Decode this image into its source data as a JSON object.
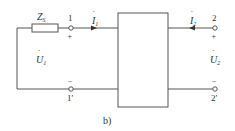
{
  "diagram": {
    "caption": "b)",
    "impedance": {
      "symbol": "Z",
      "subscript": "S"
    },
    "port1": {
      "terminal_top": "1",
      "terminal_bottom": "1′",
      "plus": "+",
      "minus": "−",
      "voltage": {
        "symbol": "U",
        "subscript": "1",
        "dot": "·"
      },
      "current": {
        "symbol": "I",
        "subscript": "1",
        "dot": "·"
      }
    },
    "port2": {
      "terminal_top": "2",
      "terminal_bottom": "2′",
      "plus": "+",
      "minus": "−",
      "voltage": {
        "symbol": "U",
        "subscript": "2",
        "dot": "·"
      },
      "current": {
        "symbol": "I",
        "subscript": "2",
        "dot": "·"
      }
    },
    "colors": {
      "line": "#555555",
      "text": "#333333"
    }
  }
}
